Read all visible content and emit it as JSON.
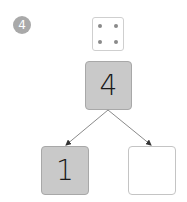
{
  "problem": {
    "number": "4",
    "badge_color": "#a9a9a9"
  },
  "dice": {
    "icon": "dice-four-icon",
    "pips": 4
  },
  "number_bond": {
    "whole": "4",
    "parts": [
      {
        "value": "1",
        "filled": true
      },
      {
        "value": "",
        "filled": false
      }
    ],
    "fill_color": "#c9c9c9"
  }
}
